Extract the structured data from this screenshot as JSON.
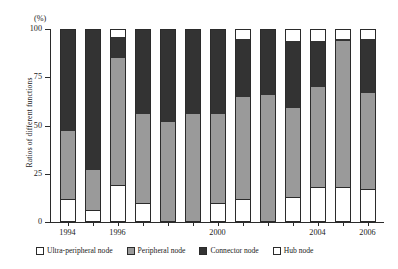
{
  "chart_data": {
    "type": "bar",
    "subtype": "stacked-bar-100-percent",
    "title": "",
    "xlabel": "",
    "ylabel": "Ratios of different functions",
    "units_label": "(%)",
    "ylim": [
      0,
      100
    ],
    "yticks": [
      0,
      25,
      50,
      75,
      100
    ],
    "ytick_labels": [
      "0",
      "25",
      "50",
      "75",
      "100"
    ],
    "grid": false,
    "legend_position": "bottom",
    "categories": [
      "1994",
      "1995",
      "1996",
      "1997",
      "1998",
      "1999",
      "2000",
      "2001",
      "2002",
      "2003",
      "2004",
      "2005",
      "2006"
    ],
    "xtick_labels": [
      "1994",
      "1996",
      "2000",
      "2004",
      "2006"
    ],
    "xtick_label_categories": [
      "1994",
      "1996",
      "2000",
      "2004",
      "2006"
    ],
    "series": [
      {
        "name": "Ultra-peripheral node",
        "color": "#ffffff",
        "values": [
          12,
          6,
          19,
          10,
          0,
          0,
          10,
          12,
          0,
          13,
          18,
          18,
          17
        ]
      },
      {
        "name": "Peripheral node",
        "color": "#9a9a9a",
        "values": [
          35,
          21,
          66,
          46,
          52,
          56,
          46,
          53,
          66,
          46,
          52,
          76,
          50
        ]
      },
      {
        "name": "Connector node",
        "color": "#333333",
        "values": [
          53,
          73,
          11,
          44,
          48,
          44,
          44,
          30,
          34,
          35,
          24,
          1,
          28
        ]
      },
      {
        "name": "Hub node",
        "color": "#ffffff",
        "values": [
          0,
          0,
          4,
          0,
          0,
          0,
          0,
          5,
          0,
          6,
          6,
          5,
          5
        ]
      }
    ]
  },
  "legend": {
    "items": [
      {
        "label": "Ultra-peripheral node",
        "color": "#ffffff"
      },
      {
        "label": "Peripheral node",
        "color": "#9a9a9a"
      },
      {
        "label": "Connector node",
        "color": "#333333"
      },
      {
        "label": "Hub node",
        "color": "#ffffff"
      }
    ]
  },
  "axis": {
    "units": "(%)",
    "y_title": "Ratios of different functions"
  },
  "colors": {
    "axis": "#2b2b2b",
    "ultra_peripheral": "#ffffff",
    "peripheral": "#9a9a9a",
    "connector": "#333333",
    "hub": "#ffffff",
    "background": "#ffffff"
  }
}
